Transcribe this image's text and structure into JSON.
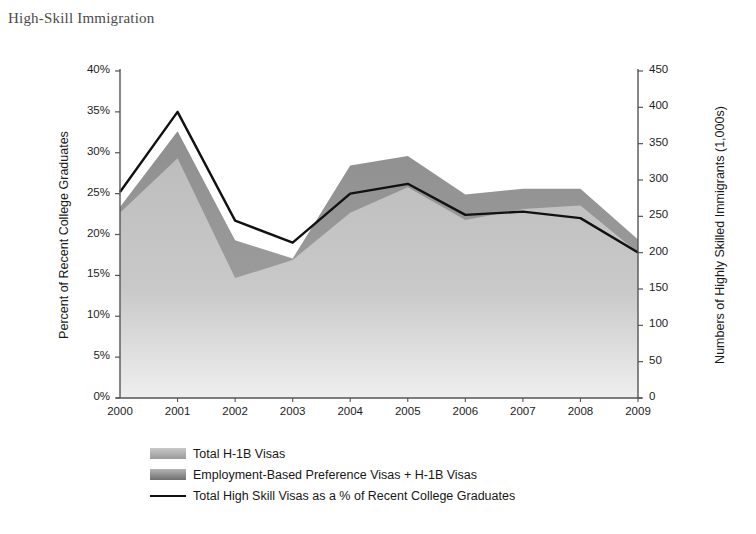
{
  "figure": {
    "title": "High-Skill Immigration"
  },
  "chart_data": {
    "type": "area",
    "title": "High-Skill Immigration",
    "xlabel": "",
    "ylabel": "Percent of Recent College Graduates",
    "y2label": "Numbers of Highly Skilled Immigrants (1,000s)",
    "categories": [
      "2000",
      "2001",
      "2002",
      "2003",
      "2004",
      "2005",
      "2006",
      "2007",
      "2008",
      "2009"
    ],
    "x": [
      2000,
      2001,
      2002,
      2003,
      2004,
      2005,
      2006,
      2007,
      2008,
      2009
    ],
    "ylim": [
      0,
      40
    ],
    "y2lim": [
      0,
      450
    ],
    "yticks": [
      "0%",
      "5%",
      "10%",
      "15%",
      "20%",
      "25%",
      "30%",
      "35%",
      "40%"
    ],
    "ytick_values": [
      0,
      5,
      10,
      15,
      20,
      25,
      30,
      35,
      40
    ],
    "y2ticks": [
      "0",
      "50",
      "100",
      "150",
      "200",
      "250",
      "300",
      "350",
      "400",
      "450"
    ],
    "y2tick_values": [
      0,
      50,
      100,
      150,
      200,
      250,
      300,
      350,
      400,
      450
    ],
    "grid": false,
    "legend_position": "bottom-left",
    "series": [
      {
        "name": "Total H-1B Visas",
        "type": "area",
        "unit": "thousands",
        "color": "#b0b0b0",
        "values": [
          255,
          330,
          165,
          190,
          255,
          290,
          245,
          260,
          265,
          200
        ]
      },
      {
        "name": "Employment-Based Preference Visas + H-1B Visas",
        "type": "area",
        "unit": "thousands",
        "color": "#8a8a8a",
        "values": [
          263,
          367,
          217,
          192,
          320,
          333,
          280,
          288,
          288,
          218
        ]
      },
      {
        "name": "Total High Skill Visas as a % of Recent College Graduates",
        "type": "line",
        "unit": "percent",
        "color": "#111111",
        "values": [
          25.2,
          35.0,
          21.7,
          19.0,
          25.0,
          26.2,
          22.4,
          22.8,
          22.0,
          17.8
        ]
      }
    ],
    "legend": [
      {
        "label": "Total H-1B Visas",
        "marker": "area-swatch-light"
      },
      {
        "label": "Employment-Based Preference Visas + H-1B Visas",
        "marker": "area-swatch-dark"
      },
      {
        "label": "Total High Skill Visas as a % of Recent College Graduates",
        "marker": "line"
      }
    ]
  },
  "colors": {
    "area_light": "#b0b0b0",
    "area_dark": "#8a8a8a",
    "line": "#111111",
    "axis": "#555555",
    "title_text": "#4a4a4a"
  }
}
